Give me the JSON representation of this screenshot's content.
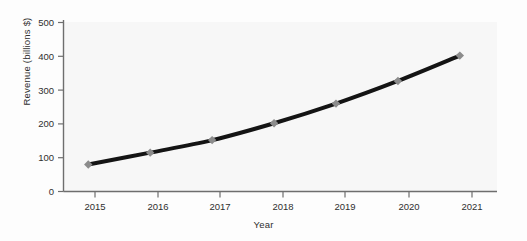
{
  "chart_data": {
    "type": "line",
    "title": "",
    "xlabel": "Year",
    "ylabel": "Revenue (billions $)",
    "categories": [
      "2015",
      "2016",
      "2017",
      "2018",
      "2019",
      "2020",
      "2021"
    ],
    "x": [
      2015,
      2016,
      2017,
      2018,
      2019,
      2020,
      2021
    ],
    "values": [
      80,
      115,
      152,
      202,
      260,
      327,
      402
    ],
    "series": [
      {
        "name": "Revenue",
        "values": [
          80,
          115,
          152,
          202,
          260,
          327,
          402
        ]
      }
    ],
    "xlim": [
      2014.6,
      2021.6
    ],
    "ylim": [
      0,
      500
    ],
    "yticks": [
      0,
      100,
      200,
      300,
      400,
      500
    ],
    "ytick_labels": [
      "0",
      "100",
      "200",
      "300",
      "400",
      "500"
    ],
    "xticks": [
      2015,
      2016,
      2017,
      2018,
      2019,
      2020,
      2021
    ],
    "xtick_labels": [
      "2015",
      "2016",
      "2017",
      "2018",
      "2019",
      "2020",
      "2021"
    ],
    "grid": false,
    "legend": false,
    "legend_position": "none",
    "marker": "diamond",
    "marker_color": "#8c8c8c",
    "line_color": "#141414",
    "line_width": 4,
    "background_color": "#f6f6f6",
    "axis_color": "#6e6e6e"
  }
}
